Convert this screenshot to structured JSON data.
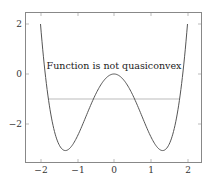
{
  "chart_data": {
    "type": "line",
    "title": "",
    "xlabel": "",
    "ylabel": "",
    "xlim": [
      -2.35,
      2.35
    ],
    "ylim": [
      -3.5,
      2.5
    ],
    "xticks": [
      -2,
      -1,
      0,
      1,
      2
    ],
    "xtick_labels": [
      "−2",
      "−1",
      "0",
      "1",
      "2"
    ],
    "yticks": [
      -2,
      0,
      2
    ],
    "ytick_labels": [
      "−2",
      "0",
      "2"
    ],
    "grid": false,
    "legend": null,
    "series": [
      {
        "name": "f(x) = x^4 - 3.5x^2",
        "color": "#555555",
        "x": [
          -2.0,
          -1.75,
          -1.5,
          -1.32,
          -1.0,
          -0.5,
          0.0,
          0.5,
          1.0,
          1.32,
          1.5,
          1.75,
          2.0
        ],
        "y": [
          2.0,
          -1.34,
          -2.81,
          -3.06,
          -2.5,
          -0.81,
          0.0,
          -0.81,
          -2.5,
          -3.06,
          -2.81,
          -1.34,
          2.0
        ]
      },
      {
        "name": "sublevel line y = -1",
        "color": "#bbbbbb",
        "x": [
          -1.77,
          1.77
        ],
        "y": [
          -1,
          -1
        ]
      }
    ],
    "annotations": [
      {
        "text": "Function is not quasiconvex",
        "x": 0,
        "y": 0.35
      }
    ]
  },
  "labels": {
    "annotation": "Function is not quasiconvex",
    "xticks": [
      "−2",
      "−1",
      "0",
      "1",
      "2"
    ],
    "yticks": [
      "2",
      "0",
      "−2"
    ]
  }
}
